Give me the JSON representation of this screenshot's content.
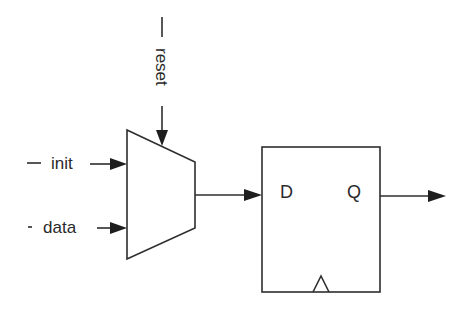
{
  "diagram": {
    "type": "circuit-schematic",
    "inputs": {
      "reset": {
        "label": "reset",
        "prefix": "—"
      },
      "init": {
        "label": "init",
        "prefix": "—"
      },
      "data": {
        "label": "data",
        "prefix": "-"
      }
    },
    "mux": {
      "name": "multiplexer"
    },
    "flipflop": {
      "name": "D flip-flop",
      "d_label": "D",
      "q_label": "Q",
      "clock": "clock-triangle"
    },
    "colors": {
      "line": "#2e2e2e",
      "text": "#2a2a2a",
      "background": "#ffffff"
    }
  }
}
